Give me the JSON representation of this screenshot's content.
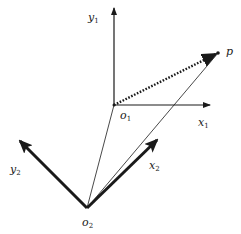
{
  "diagram": {
    "colors": {
      "ink": "#1a1a1a",
      "background": "#ffffff"
    },
    "points": {
      "o1": {
        "x": 114,
        "y": 105
      },
      "o2": {
        "x": 87,
        "y": 208
      },
      "p": {
        "x": 218,
        "y": 53
      }
    },
    "labels": {
      "y1": {
        "base": "y",
        "sub": "1"
      },
      "x1": {
        "base": "x",
        "sub": "1"
      },
      "o1": {
        "base": "o",
        "sub": "1"
      },
      "y2": {
        "base": "y",
        "sub": "2"
      },
      "x2": {
        "base": "x",
        "sub": "2"
      },
      "o2": {
        "base": "o",
        "sub": "2"
      },
      "p": {
        "base": "p"
      }
    },
    "edges": [
      {
        "name": "y1-axis",
        "from": "o1",
        "to": [
          114,
          8
        ],
        "style": "arrow-thin"
      },
      {
        "name": "x1-axis",
        "from": "o1",
        "to": [
          210,
          105
        ],
        "style": "arrow-thin"
      },
      {
        "name": "o1-to-p",
        "from": "o1",
        "to": "p",
        "style": "dotted-arrow"
      },
      {
        "name": "y2-axis",
        "from": "o2",
        "to": [
          20,
          141
        ],
        "style": "arrow-thick"
      },
      {
        "name": "x2-axis",
        "from": "o2",
        "to": [
          157,
          140
        ],
        "style": "arrow-thick"
      },
      {
        "name": "o2-to-o1",
        "from": "o2",
        "to": "o1",
        "style": "line-thin"
      },
      {
        "name": "o2-to-p",
        "from": "o2",
        "to": "p",
        "style": "line-thin"
      }
    ]
  }
}
